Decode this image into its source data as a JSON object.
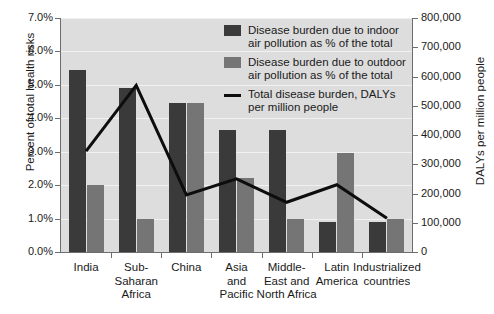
{
  "title_partial": "",
  "axes": {
    "left": {
      "title": "Percent of total health risks",
      "ticks": [
        "0.0%",
        "1.0%",
        "2.0%",
        "3.0%",
        "4.0%",
        "5.0%",
        "6.0%",
        "7.0%"
      ],
      "min": 0,
      "max": 7
    },
    "right": {
      "title": "DALYs per million people",
      "ticks": [
        "0",
        "100,000",
        "200,000",
        "300,000",
        "400,000",
        "500,000",
        "600,000",
        "700,000",
        "800,000"
      ],
      "min": 0,
      "max": 800000
    }
  },
  "legend": {
    "items": [
      {
        "marker": "bar-dark",
        "label": "Disease burden due to indoor\nair pollution as % of the total",
        "color": "#3a3a3a"
      },
      {
        "marker": "bar-gray",
        "label": "Disease burden due to outdoor\nair pollution as % of the total",
        "color": "#757575"
      },
      {
        "marker": "line",
        "label": "Total disease burden, DALYs\nper million people",
        "color": "#0d0d0d"
      }
    ]
  },
  "categories_display": [
    "India",
    "Sub-\nSaharan\nAfrica",
    "China",
    "Asia\nand\nPacific",
    "Middle-\nEast and\nNorth Africa",
    "Latin\nAmerica",
    "Industrialized\ncountries"
  ],
  "chart_data": {
    "type": "bar",
    "title": "",
    "categories": [
      "India",
      "Sub-Saharan Africa",
      "China",
      "Asia and Pacific",
      "Middle-East and North Africa",
      "Latin America",
      "Industrialized countries"
    ],
    "series": [
      {
        "name": "Disease burden due to indoor air pollution as % of the total",
        "type": "bar",
        "axis": "left",
        "color": "#3a3a3a",
        "values": [
          5.45,
          4.9,
          4.45,
          3.65,
          3.65,
          0.9,
          0.9
        ]
      },
      {
        "name": "Disease burden due to outdoor air pollution as % of the total",
        "type": "bar",
        "axis": "left",
        "color": "#757575",
        "values": [
          2.0,
          1.0,
          4.45,
          2.2,
          1.0,
          2.95,
          1.0
        ]
      },
      {
        "name": "Total disease burden, DALYs per million people",
        "type": "line",
        "axis": "right",
        "color": "#0d0d0d",
        "values": [
          345000,
          570000,
          195000,
          250000,
          170000,
          230000,
          115000
        ]
      }
    ],
    "xlabel": "",
    "ylabel": "Percent of total health risks",
    "ylabel_right": "DALYs per million people",
    "ylim": [
      0,
      7
    ],
    "ylim_right": [
      0,
      800000
    ],
    "grid": true,
    "legend_position": "top-right",
    "plot_background": "#dddddd"
  }
}
